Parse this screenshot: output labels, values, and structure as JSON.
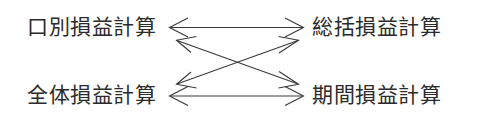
{
  "diagram": {
    "title_text": "",
    "background_color": "#ffffff",
    "line_color": "#3a3a3a",
    "text_color": "#2b2b2b",
    "nodes": [
      {
        "id": "top-left",
        "label": "口別損益計算"
      },
      {
        "id": "top-right",
        "label": "総括損益計算"
      },
      {
        "id": "bottom-left",
        "label": "全体損益計算"
      },
      {
        "id": "bottom-right",
        "label": "期間損益計算"
      }
    ],
    "connectors": [
      {
        "id": "top-horizontal",
        "from": "top-left",
        "to": "top-right",
        "style": "double-headed-arrow"
      },
      {
        "id": "bottom-horizontal",
        "from": "bottom-left",
        "to": "bottom-right",
        "style": "double-headed-arrow"
      },
      {
        "id": "diagonal-down-right",
        "from": "top-left",
        "to": "bottom-right",
        "style": "double-headed-arrow"
      },
      {
        "id": "diagonal-up-right",
        "from": "bottom-left",
        "to": "top-right",
        "style": "double-headed-arrow"
      }
    ]
  }
}
